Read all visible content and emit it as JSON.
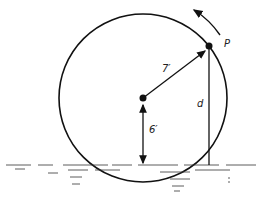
{
  "diagram": {
    "labels": {
      "point": "P",
      "radius": "7′",
      "height": "6′",
      "distance": "d"
    },
    "colors": {
      "stroke": "#111111",
      "background": "#ffffff"
    }
  }
}
